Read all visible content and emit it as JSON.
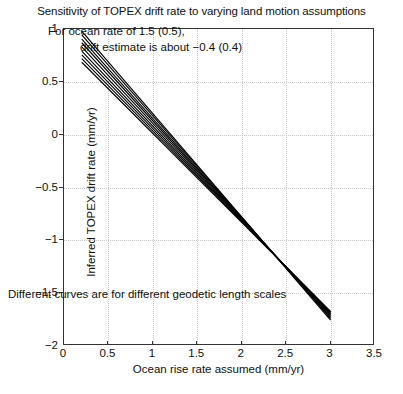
{
  "figure": {
    "title": "Sensitivity of TOPEX drift rate to varying land motion assumptions",
    "annotations": {
      "main_line1": "For ocean rate of 1.5 (0.5),",
      "main_line2": "drift estimate is about −0.4 (0.4)",
      "bottom": "Different curves are for different geodetic length scales"
    }
  },
  "chart_data": {
    "type": "line",
    "title": "Sensitivity of TOPEX drift rate to varying land motion assumptions",
    "xlabel": "Ocean rise rate assumed (mm/yr)",
    "ylabel": "Inferred TOPEX drift rate (mm/yr)",
    "xlim": [
      0,
      3.5
    ],
    "ylim": [
      -2,
      1
    ],
    "xticks": [
      0,
      0.5,
      1,
      1.5,
      2,
      2.5,
      3,
      3.5
    ],
    "xticklabels": [
      "0",
      "0.5",
      "1",
      "1.5",
      "2",
      "2.5",
      "3",
      "3.5"
    ],
    "yticks": [
      -2,
      -1.5,
      -1,
      -0.5,
      0,
      0.5,
      1
    ],
    "yticklabels": [
      "−2",
      "−1.5",
      "−1",
      "−0.5",
      "0",
      "0.5",
      "1"
    ],
    "grid": true,
    "grid_style": "dotted",
    "legend": "none",
    "line_color": "#000000",
    "annotations": [
      {
        "text": "For ocean rate of 1.5 (0.5), drift estimate is about −0.4 (0.4)",
        "x": 1.1,
        "y": 0.78
      },
      {
        "text": "Different curves are for different geodetic length scales",
        "x": 0.12,
        "y": -1.84
      }
    ],
    "series": [
      {
        "name": "geodetic length scale 1",
        "x": [
          0.2,
          3.0
        ],
        "y": [
          0.98,
          -1.755
        ]
      },
      {
        "name": "geodetic length scale 2",
        "x": [
          0.2,
          3.0
        ],
        "y": [
          0.945,
          -1.742
        ]
      },
      {
        "name": "geodetic length scale 3",
        "x": [
          0.2,
          3.0
        ],
        "y": [
          0.905,
          -1.73
        ]
      },
      {
        "name": "geodetic length scale 4",
        "x": [
          0.2,
          3.0
        ],
        "y": [
          0.87,
          -1.72
        ]
      },
      {
        "name": "geodetic length scale 5",
        "x": [
          0.2,
          3.0
        ],
        "y": [
          0.83,
          -1.708
        ]
      },
      {
        "name": "geodetic length scale 6",
        "x": [
          0.2,
          3.0
        ],
        "y": [
          0.79,
          -1.697
        ]
      },
      {
        "name": "geodetic length scale 7",
        "x": [
          0.2,
          3.0
        ],
        "y": [
          0.755,
          -1.688
        ]
      },
      {
        "name": "geodetic length scale 8",
        "x": [
          0.2,
          3.0
        ],
        "y": [
          0.72,
          -1.68
        ]
      },
      {
        "name": "geodetic length scale 9",
        "x": [
          0.2,
          3.0
        ],
        "y": [
          0.685,
          -1.672
        ]
      }
    ]
  }
}
